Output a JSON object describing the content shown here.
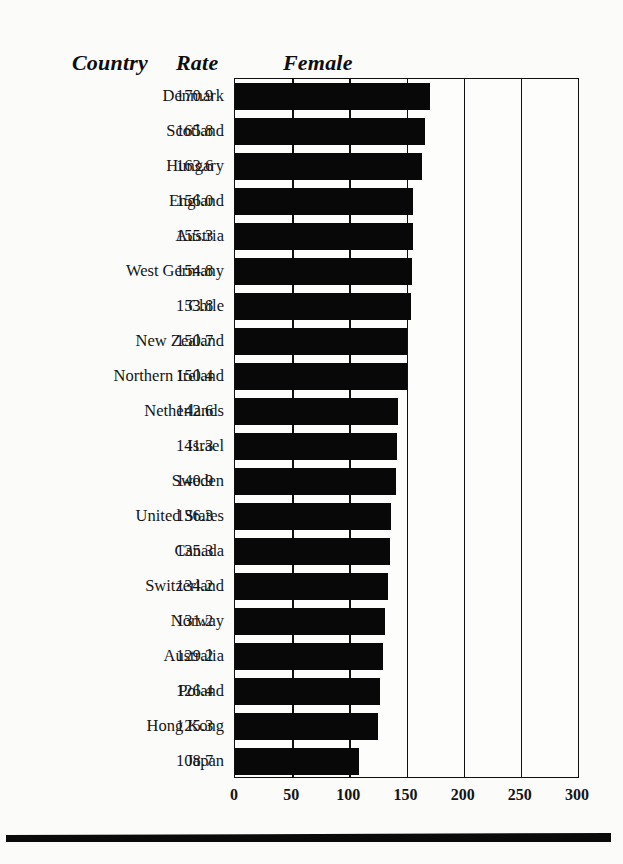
{
  "header": {
    "country_label": "Country",
    "rate_label": "Rate",
    "series_label": "Female"
  },
  "axis": {
    "ticks": [
      "0",
      "50",
      "100",
      "150",
      "200",
      "250",
      "300"
    ]
  },
  "chart_data": {
    "type": "bar",
    "orientation": "horizontal",
    "title": "Female",
    "xlabel": "",
    "ylabel": "Country",
    "xlim": [
      0,
      300
    ],
    "grid": true,
    "legend": "none",
    "bar_color": "#080808",
    "categories": [
      "Denmark",
      "Scotland",
      "Hungary",
      "England",
      "Austria",
      "West Germany",
      "Chile",
      "New Zealand",
      "Northern Ireland",
      "Netherlands",
      "Israel",
      "Sweden",
      "United States",
      "Canada",
      "Switzerland",
      "Norway",
      "Australia",
      "Poland",
      "Hong Kong",
      "Japan"
    ],
    "values": [
      170.9,
      165.8,
      163.6,
      156.0,
      155.3,
      154.8,
      153.8,
      150.7,
      150.4,
      142.6,
      141.3,
      140.9,
      136.3,
      135.3,
      134.2,
      131.2,
      129.2,
      126.4,
      125.3,
      108.7
    ],
    "value_labels": [
      "170.9",
      "165.8",
      "163.6",
      "156.0",
      "155.3",
      "154.8",
      "153.8",
      "150.7",
      "150.4",
      "142.6",
      "141.3",
      "140.9",
      "136.3",
      "135.3",
      "134.2",
      "131.2",
      "129.2",
      "126.4",
      "125.3",
      "108.7"
    ]
  }
}
